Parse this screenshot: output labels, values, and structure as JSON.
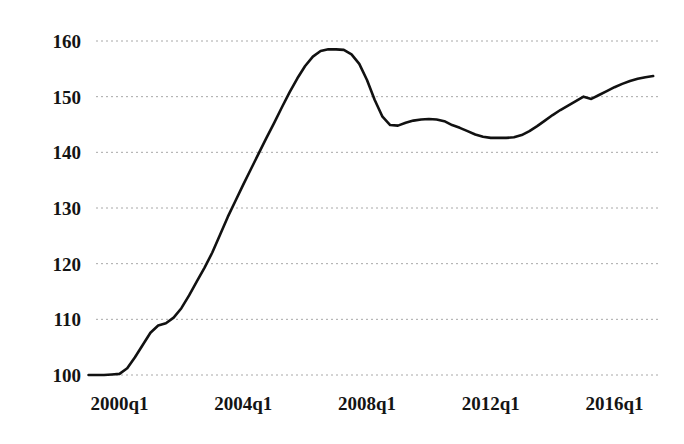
{
  "chart_data": {
    "type": "line",
    "title": "",
    "subtitle": "",
    "xlabel": "",
    "ylabel": "",
    "grid": "horizontal-dotted",
    "legend": "none",
    "line_color": "#111111",
    "grid_color": "#9a9a9a",
    "background": "#ffffff",
    "xlim": [
      "1999q1",
      "2017q2"
    ],
    "ylim": [
      98,
      162
    ],
    "yticks": [
      100,
      110,
      120,
      130,
      140,
      150,
      160
    ],
    "ytick_labels": [
      "100",
      "110",
      "120",
      "130",
      "140",
      "150",
      "160"
    ],
    "xticks": [
      "2000q1",
      "2004q1",
      "2008q1",
      "2012q1",
      "2016q1"
    ],
    "xtick_labels": [
      "2000q1",
      "2004q1",
      "2008q1",
      "2012q1",
      "2016q1"
    ],
    "x": [
      "1999q1",
      "1999q2",
      "1999q3",
      "1999q4",
      "2000q1",
      "2000q2",
      "2000q3",
      "2000q4",
      "2001q1",
      "2001q2",
      "2001q3",
      "2001q4",
      "2002q1",
      "2002q2",
      "2002q3",
      "2002q4",
      "2003q1",
      "2003q2",
      "2003q3",
      "2003q4",
      "2004q1",
      "2004q2",
      "2004q3",
      "2004q4",
      "2005q1",
      "2005q2",
      "2005q3",
      "2005q4",
      "2006q1",
      "2006q2",
      "2006q3",
      "2006q4",
      "2007q1",
      "2007q2",
      "2007q3",
      "2007q4",
      "2008q1",
      "2008q2",
      "2008q3",
      "2008q4",
      "2009q1",
      "2009q2",
      "2009q3",
      "2009q4",
      "2010q1",
      "2010q2",
      "2010q3",
      "2010q4",
      "2011q1",
      "2011q2",
      "2011q3",
      "2011q4",
      "2012q1",
      "2012q2",
      "2012q3",
      "2012q4",
      "2013q1",
      "2013q2",
      "2013q3",
      "2013q4",
      "2014q1",
      "2014q2",
      "2014q3",
      "2014q4",
      "2015q1",
      "2015q2",
      "2015q3",
      "2015q4",
      "2016q1",
      "2016q2",
      "2016q3",
      "2016q4",
      "2017q1",
      "2017q2"
    ],
    "values": [
      100.0,
      100.0,
      100.0,
      100.1,
      100.2,
      101.2,
      103.2,
      105.4,
      107.6,
      108.9,
      109.3,
      110.3,
      112.0,
      114.3,
      116.8,
      119.3,
      122.0,
      125.2,
      128.4,
      131.3,
      134.2,
      137.0,
      139.8,
      142.6,
      145.3,
      148.1,
      150.8,
      153.3,
      155.5,
      157.2,
      158.2,
      158.5,
      158.5,
      158.4,
      157.6,
      155.9,
      153.0,
      149.4,
      146.4,
      144.9,
      144.8,
      145.3,
      145.7,
      145.9,
      146.0,
      145.9,
      145.6,
      144.9,
      144.4,
      143.8,
      143.2,
      142.8,
      142.6,
      142.6,
      142.6,
      142.7,
      143.1,
      143.8,
      144.7,
      145.7,
      146.7,
      147.6,
      148.4,
      149.2,
      150.0,
      149.6,
      150.3,
      151.0,
      151.7,
      152.3,
      152.8,
      153.2,
      153.5,
      153.7
    ]
  }
}
